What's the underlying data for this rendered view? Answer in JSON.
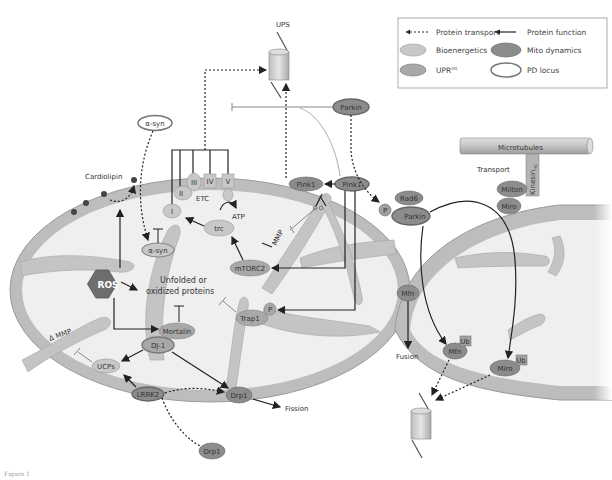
{
  "legend": {
    "protein_transport": "Protein transport",
    "protein_function": "Protein function",
    "bioenergetics": "Bioenergetics",
    "mito_dynamics": "Mito dynamics",
    "uprmt": "UPR",
    "uprmt_sup": "mt",
    "pd_locus": "PD locus"
  },
  "colors": {
    "bioenergetics": "#c8c8c8",
    "mito_dynamics": "#8c8c8c",
    "uprmt": "#a8a8a8",
    "pd_locus_stroke": "#777777",
    "membrane": "#bdbdbd",
    "matrix": "#ededed",
    "ros": "#6e6e6e"
  },
  "labels": {
    "ups_top": "UPS",
    "parkin_top": "Parkin",
    "asyn_top": "α-syn",
    "cardiolipin": "Cardiolipin",
    "etc": "ETC",
    "complex_1": "I",
    "complex_2": "II",
    "complex_3": "III",
    "complex_4": "IV",
    "complex_5": "V",
    "atp": "ATP",
    "trc": "trc",
    "asyn_inner": "α-syn",
    "ros": "ROS",
    "unfolded_1": "Unfolded or",
    "unfolded_2": "oxidized proteins",
    "mtorc2": "mTORC2",
    "mmp": "MMP",
    "pink1_membrane": "Pink1",
    "pink1_outer": "Pink1",
    "rad6": "Rad6",
    "p_parkin": "P",
    "parkin_right": "Parkin",
    "trap1": "Trap1",
    "p_trap1": "P",
    "mortalin": "Mortalin",
    "dj1": "DJ-1",
    "delta_mmp": "Δ MMP",
    "ucps": "UCPs",
    "lrrk2": "LRRK2",
    "drp1_membrane": "Drp1",
    "fission": "Fission",
    "drp1_bottom": "Drp1",
    "microtubules": "Microtubules",
    "transport": "Transport",
    "kinesin": "Kinesin",
    "kinesin_sub": "HC",
    "milton": "Milton",
    "miro_top": "Miro",
    "mfn_junction": "Mfn",
    "fusion": "Fusion",
    "mfn_ub": "Mfn",
    "ub_mfn": "Ub",
    "miro_ub": "Miro",
    "ub_miro": "Ub",
    "figure_caption": "Figure 1"
  }
}
